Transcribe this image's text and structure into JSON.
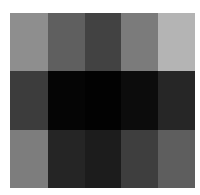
{
  "chart_data": {
    "type": "heatmap",
    "title": "",
    "xlabel": "",
    "ylabel": "",
    "rows": 3,
    "cols": 5,
    "colormap": "grayscale",
    "values": [
      [
        "#8e8e8e",
        "#5f5f5f",
        "#424242",
        "#7b7b7b",
        "#b4b4b4"
      ],
      [
        "#3c3c3c",
        "#050505",
        "#020202",
        "#0c0c0c",
        "#262626"
      ],
      [
        "#7d7d7d",
        "#252525",
        "#1c1c1c",
        "#3e3e3e",
        "#5e5e5e"
      ]
    ]
  }
}
